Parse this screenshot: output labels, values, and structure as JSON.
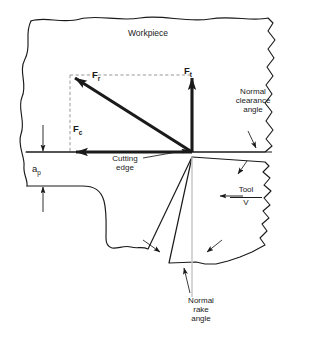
{
  "figure": {
    "type": "engineering-diagram",
    "workpiece_label": "Workpiece",
    "forces": {
      "resultant": {
        "symbol": "F",
        "subscript": "r",
        "name": "resultant-force"
      },
      "thrust": {
        "symbol": "F",
        "subscript": "t",
        "name": "thrust-force"
      },
      "cutting": {
        "symbol": "F",
        "subscript": "c",
        "name": "cutting-force"
      }
    },
    "dimensions": {
      "depth_of_cut": {
        "symbol": "a",
        "subscript": "p",
        "name": "depth-of-cut"
      }
    },
    "annotations": {
      "cutting_edge": {
        "line1": "Cutting",
        "line2": "edge"
      },
      "normal_clearance_angle": {
        "line1": "Normal",
        "line2": "clearance",
        "line3": "angle"
      },
      "normal_rake_angle": {
        "line1": "Normal",
        "line2": "rake",
        "line3": "angle"
      },
      "tool": {
        "label": "Tool",
        "velocity": "V"
      }
    },
    "colors": {
      "ink": "#1a1a1a",
      "background": "#ffffff",
      "construction_line": "#9a9a9a",
      "reference_line": "#c9c9c9"
    }
  }
}
